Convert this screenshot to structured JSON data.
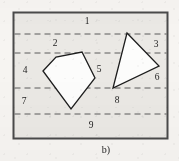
{
  "figure": {
    "caption": "b)",
    "frame": {
      "x": 13.5,
      "y": 12.5,
      "width": 154,
      "height": 126,
      "stroke": "#4a4a4a",
      "stroke_width": 2,
      "fill": "#ebe9e5"
    },
    "dashed_lines": [
      {
        "id": "dash-1",
        "y": 34
      },
      {
        "id": "dash-2",
        "y": 53
      },
      {
        "id": "dash-3",
        "y": 88
      },
      {
        "id": "dash-4",
        "y": 114
      }
    ],
    "dash_style": {
      "stroke": "#5a5a5a",
      "stroke_width": 1,
      "dash_array": "6 4"
    },
    "polygons": [
      {
        "id": "pentagon",
        "name": "pentagon-shape",
        "points": "43,71 56,57 82,52 95,78 71,109 43,71",
        "fill": "#fdfdfc",
        "stroke": "#1d1d1d",
        "stroke_width": 1.3
      },
      {
        "id": "triangle",
        "name": "triangle-shape",
        "points": "127,33 159,66 113,88 127,33",
        "fill": "#fdfdfc",
        "stroke": "#1d1d1d",
        "stroke_width": 1.3
      }
    ],
    "region_labels": [
      {
        "id": "label-1",
        "text": "1",
        "x": 87,
        "y": 22
      },
      {
        "id": "label-2",
        "text": "2",
        "x": 55,
        "y": 44
      },
      {
        "id": "label-3",
        "text": "3",
        "x": 156,
        "y": 45
      },
      {
        "id": "label-4",
        "text": "4",
        "x": 25,
        "y": 71
      },
      {
        "id": "label-5",
        "text": "5",
        "x": 99,
        "y": 70
      },
      {
        "id": "label-6",
        "text": "6",
        "x": 157,
        "y": 78
      },
      {
        "id": "label-7",
        "text": "7",
        "x": 24,
        "y": 102
      },
      {
        "id": "label-8",
        "text": "8",
        "x": 117,
        "y": 101
      },
      {
        "id": "label-9",
        "text": "9",
        "x": 91,
        "y": 126
      }
    ],
    "caption_pos": {
      "x": 106,
      "y": 151
    }
  }
}
